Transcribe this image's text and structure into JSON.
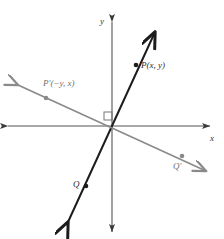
{
  "figure": {
    "name": "rotation-90-coordinate-plane-diagram",
    "background_color": "#ffffff",
    "width": 224,
    "height": 239
  },
  "axes": {
    "x_label": "x",
    "y_label": "y",
    "origin": {
      "x": 112,
      "y": 126
    },
    "color": "#555555",
    "x_axis": {
      "x1": 8,
      "y1": 126,
      "x2": 210,
      "y2": 126,
      "arrow_start": true,
      "arrow_end": true
    },
    "y_axis": {
      "x1": 112,
      "y1": 22,
      "x2": 112,
      "y2": 232,
      "arrow_start": true,
      "arrow_end": true
    }
  },
  "right_angle_marker": {
    "label": "right-angle-marker",
    "x": 104,
    "y": 112,
    "size": 8,
    "color": "#777777"
  },
  "lines": [
    {
      "name": "line-OP",
      "description": "original line through origin containing P and Q",
      "color": "#1c1c1c",
      "width": 2,
      "x1": 68,
      "y1": 222,
      "x2": 155,
      "y2": 32,
      "arrow_start": true,
      "arrow_end": true
    },
    {
      "name": "line-OP-prime",
      "description": "image line after 90 degree rotation containing P-prime and Q-prime",
      "color": "#8a8a8a",
      "width": 1.6,
      "x1": 18,
      "y1": 85,
      "x2": 206,
      "y2": 171,
      "arrow_start": true,
      "arrow_end": true
    }
  ],
  "points": [
    {
      "name": "point-P",
      "label": "P(x, y)",
      "x": 136,
      "y": 65,
      "dot_color": "#1c1c1c",
      "label_color": "#2a2a2a"
    },
    {
      "name": "point-P-prime",
      "label": "P'(−y, x)",
      "x": 46,
      "y": 98,
      "dot_color": "#8a8a8a",
      "label_color": "#6e6e6e"
    },
    {
      "name": "point-Q",
      "label": "Q",
      "x": 86,
      "y": 186,
      "dot_color": "#1c1c1c",
      "label_color": "#2a2a2a"
    },
    {
      "name": "point-Q-prime",
      "label": "Q'",
      "x": 182,
      "y": 156,
      "dot_color": "#8a8a8a",
      "label_color": "#6e6e6e"
    }
  ]
}
